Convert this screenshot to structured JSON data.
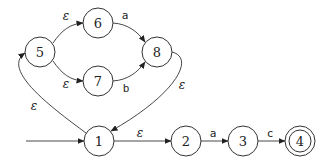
{
  "diagram": {
    "type": "nfa",
    "start_state": "1",
    "accept_states": [
      "4"
    ],
    "states": [
      {
        "id": "1",
        "label": "1",
        "x": 99,
        "y": 141
      },
      {
        "id": "2",
        "label": "2",
        "x": 186,
        "y": 141
      },
      {
        "id": "3",
        "label": "3",
        "x": 243,
        "y": 141
      },
      {
        "id": "4",
        "label": "4",
        "x": 300,
        "y": 141
      },
      {
        "id": "5",
        "label": "5",
        "x": 40,
        "y": 52
      },
      {
        "id": "6",
        "label": "6",
        "x": 98,
        "y": 23
      },
      {
        "id": "7",
        "label": "7",
        "x": 98,
        "y": 81
      },
      {
        "id": "8",
        "label": "8",
        "x": 157,
        "y": 52
      }
    ],
    "transitions": [
      {
        "from": "1",
        "to": "5",
        "label": "ε"
      },
      {
        "from": "5",
        "to": "6",
        "label": "ε"
      },
      {
        "from": "5",
        "to": "7",
        "label": "ε"
      },
      {
        "from": "6",
        "to": "8",
        "label": "a"
      },
      {
        "from": "7",
        "to": "8",
        "label": "b"
      },
      {
        "from": "8",
        "to": "1",
        "label": "ε"
      },
      {
        "from": "1",
        "to": "2",
        "label": "ε"
      },
      {
        "from": "2",
        "to": "3",
        "label": "a"
      },
      {
        "from": "3",
        "to": "4",
        "label": "c"
      }
    ]
  },
  "labels": {
    "s1": "1",
    "s2": "2",
    "s3": "3",
    "s4": "4",
    "s5": "5",
    "s6": "6",
    "s7": "7",
    "s8": "8",
    "t_1_5": "ε",
    "t_5_6": "ε",
    "t_5_7": "ε",
    "t_6_8": "a",
    "t_7_8": "b",
    "t_8_1": "ε",
    "t_1_2": "ε",
    "t_2_3": "a",
    "t_3_4": "c"
  }
}
